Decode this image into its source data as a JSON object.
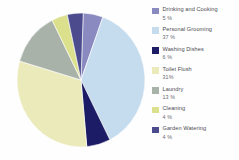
{
  "chart_data": {
    "type": "pie",
    "title": "",
    "subtitle": "",
    "xlabel": "",
    "ylabel": "",
    "legend_position": "right",
    "grid": false,
    "unit": "%",
    "categories": [
      "Drinking and Cooking",
      "Personal Grooming",
      "Washing Dishes",
      "Toilet Flush",
      "Laundry",
      "Cleaning",
      "Garden Watering"
    ],
    "values": [
      5,
      37,
      6,
      31,
      13,
      4,
      4
    ],
    "value_labels": [
      "5 %",
      "37 %",
      "6 %",
      "31%",
      "13 %",
      "4 %",
      "4 %"
    ],
    "colors": [
      "#8a8ac0",
      "#c5dcef",
      "#1c1c66",
      "#ebeabb",
      "#a8b2a8",
      "#dbe08c",
      "#4b4b8e"
    ],
    "total": 100
  },
  "legend": {
    "items": [
      {
        "label": "Drinking and Cooking",
        "value": "5 %",
        "color": "#8a8ac0"
      },
      {
        "label": "Personal Grooming",
        "value": "37 %",
        "color": "#c5dcef"
      },
      {
        "label": "Washing Dishes",
        "value": "6 %",
        "color": "#1c1c66"
      },
      {
        "label": "Toilet Flush",
        "value": "31%",
        "color": "#ebeabb"
      },
      {
        "label": "Laundry",
        "value": "13 %",
        "color": "#a8b2a8"
      },
      {
        "label": "Cleaning",
        "value": "4 %",
        "color": "#dbe08c"
      },
      {
        "label": "Garden Watering",
        "value": "4 %",
        "color": "#4b4b8e"
      }
    ]
  }
}
